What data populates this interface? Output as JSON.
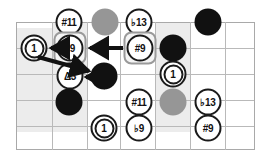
{
  "diagram": {
    "grid": {
      "columns": 7,
      "rows": 5,
      "line_color": "#b9b9b9",
      "shade_color": "#ececec"
    },
    "colors": {
      "ink": "#111111",
      "gray_dot": "#969696",
      "black_dot": "#111111",
      "highlight_border": "#9a9a9a",
      "highlight_fill": "#f4f4f4"
    },
    "markers": [
      {
        "id": "m-sharp11-top",
        "label": "#11",
        "kind": "open-circle",
        "name": "marker-sharp11-top"
      },
      {
        "id": "m-gray-top",
        "label": "",
        "kind": "gray-dot",
        "name": "marker-gray-dot-top"
      },
      {
        "id": "m-flat13-top",
        "label": "♭13",
        "kind": "open-circle",
        "name": "marker-flat13-top"
      },
      {
        "id": "m-black-top",
        "label": "",
        "kind": "black-dot",
        "name": "marker-black-dot-top"
      },
      {
        "id": "m-root-left",
        "label": "1",
        "kind": "root-circle",
        "name": "marker-root-left"
      },
      {
        "id": "m-flat9-box",
        "label": "♭9",
        "kind": "open-circle-boxed",
        "name": "marker-flat9-boxed"
      },
      {
        "id": "m-sharp9-box",
        "label": "#9",
        "kind": "open-circle-boxed",
        "name": "marker-sharp9-boxed"
      },
      {
        "id": "m-black-r2",
        "label": "",
        "kind": "black-dot",
        "name": "marker-black-dot-row2"
      },
      {
        "id": "m-delta3",
        "label": "Δ3",
        "kind": "open-circle",
        "name": "marker-delta3"
      },
      {
        "id": "m-black-r3",
        "label": "",
        "kind": "black-dot",
        "name": "marker-black-dot-row3"
      },
      {
        "id": "m-root-mid",
        "label": "1",
        "kind": "root-circle",
        "name": "marker-root-middle"
      },
      {
        "id": "m-black-r4",
        "label": "",
        "kind": "black-dot",
        "name": "marker-black-dot-row4"
      },
      {
        "id": "m-sharp11-low",
        "label": "#11",
        "kind": "open-circle",
        "name": "marker-sharp11-lower"
      },
      {
        "id": "m-gray-low",
        "label": "",
        "kind": "gray-dot",
        "name": "marker-gray-dot-lower"
      },
      {
        "id": "m-flat13-low",
        "label": "♭13",
        "kind": "open-circle",
        "name": "marker-flat13-lower"
      },
      {
        "id": "m-root-bottom",
        "label": "1",
        "kind": "root-circle",
        "name": "marker-root-bottom"
      },
      {
        "id": "m-flat9-bottom",
        "label": "♭9",
        "kind": "open-circle",
        "name": "marker-flat9-bottom"
      },
      {
        "id": "m-sharp9-bottom",
        "label": "#9",
        "kind": "open-circle",
        "name": "marker-sharp9-bottom"
      }
    ],
    "arrows": [
      {
        "name": "arrow-sharp9-to-flat9",
        "from": "m-sharp9-box",
        "to": "m-flat9-box",
        "style": "thick-horizontal"
      },
      {
        "name": "arrow-flat9-to-root",
        "from": "m-flat9-box",
        "to": "m-root-left",
        "style": "thick-horizontal"
      },
      {
        "name": "arrow-root-to-black",
        "from": "m-root-left",
        "to": "m-black-r3",
        "style": "thick-diagonal"
      },
      {
        "name": "arrow-black-to-delta3",
        "from": "m-black-r3",
        "to": "m-delta3",
        "style": "thick-horizontal-short"
      }
    ]
  }
}
